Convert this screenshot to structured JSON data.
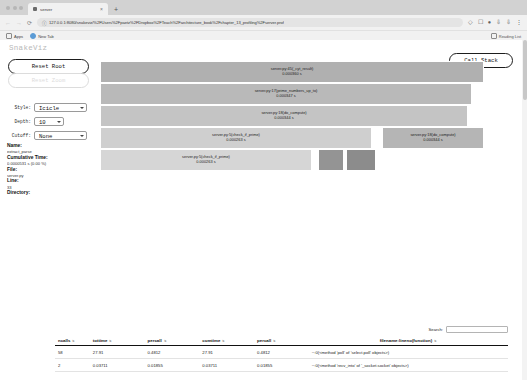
{
  "browser": {
    "tab": {
      "title": "server",
      "close_label": "×"
    },
    "new_tab_label": "+",
    "window_menu_caret": "⌄",
    "nav": {
      "back": "←",
      "forward": "→",
      "reload": "⟳"
    },
    "omnibox": {
      "lock_icon": "ⓘ",
      "url": "127.0.0.1:8080/snakeviz/%2FUsers%2Fpaetz%2FDropbox%2FTeach%2Farchitecture_book%2Fchapter_13_profiling%2Fserver.prof"
    },
    "toolbar_icons": [
      "share-icon",
      "extensions-icon",
      "profile-icon",
      "download-icon",
      "install-icon",
      "menu-icon"
    ],
    "bookmarks": [
      {
        "label": "Apps",
        "icon": "apps-icon"
      },
      {
        "label": "New Tab",
        "icon": "newtab-icon"
      }
    ],
    "reading_list": "Reading List"
  },
  "app": {
    "title": "SnakeViz",
    "reset_root_label": "Reset Root",
    "reset_zoom_label": "Reset Zoom",
    "call_stack_label": "Call Stack"
  },
  "controls": [
    {
      "name": "style",
      "label": "Style:",
      "value": "Icicle",
      "options": [
        "Icicle",
        "Sunburst"
      ]
    },
    {
      "name": "depth",
      "label": "Depth:",
      "value": "10",
      "options": [
        "5",
        "10",
        "15",
        "20"
      ]
    },
    {
      "name": "cutoff",
      "label": "Cutoff:",
      "value": "None",
      "options": [
        "None",
        "0.001",
        "0.01",
        "0.1"
      ]
    }
  ],
  "info": {
    "name_key": "Name:",
    "name_value": "extract_parse",
    "cumtime_key": "Cumulative Time:",
    "cumtime_value": "0.0000531 s (0.00 %)",
    "file_key": "File:",
    "file_value": "server.py",
    "line_key": "Line:",
    "line_value": "33",
    "directory_key": "Directory:",
    "directory_value": ""
  },
  "chart_data": {
    "type": "icicle",
    "units": "s",
    "frames": [
      {
        "label": "server.py:45(_cyt_result)",
        "time": "0.000360 s",
        "depth": 0,
        "x_pct": 0.0,
        "w_pct": 96.0,
        "color": "#b0b0b0"
      },
      {
        "label": "server.py:17(prime_numbers_up_to)",
        "time": "0.000347 s",
        "depth": 1,
        "x_pct": 0.0,
        "w_pct": 93.0,
        "color": "#b9b9b9"
      },
      {
        "label": "server.py:18(do_compute)",
        "time": "0.000344 s",
        "depth": 2,
        "x_pct": 0.0,
        "w_pct": 92.0,
        "color": "#c4c4c4"
      },
      {
        "label": "server.py:5(check_if_prime)",
        "time": "0.000263 s",
        "depth": 3,
        "x_pct": 0.0,
        "w_pct": 68.0,
        "color": "#cfcfcf"
      },
      {
        "label": "server.py:18(do_compute)",
        "time": "0.000344 s",
        "depth": 3,
        "x_pct": 70.5,
        "w_pct": 25.5,
        "color": "#b5b5b5"
      },
      {
        "label": "server.py:5(check_if_prime)",
        "time": "0.000263 s",
        "depth": 4,
        "x_pct": 0.0,
        "w_pct": 53.0,
        "color": "#d6d6d6"
      },
      {
        "label": "",
        "time": "",
        "depth": 4,
        "x_pct": 54.5,
        "w_pct": 6.5,
        "color": "#949494"
      },
      {
        "label": "",
        "time": "",
        "depth": 4,
        "x_pct": 61.5,
        "w_pct": 7.5,
        "color": "#8c8c8c"
      }
    ]
  },
  "table": {
    "search_label": "Search:",
    "search_value": "",
    "search_placeholder": "",
    "columns": [
      {
        "key": "ncalls",
        "label": "ncalls"
      },
      {
        "key": "tottime",
        "label": "tottime"
      },
      {
        "key": "percall1",
        "label": "percall"
      },
      {
        "key": "cumtime",
        "label": "cumtime"
      },
      {
        "key": "percall2",
        "label": "percall"
      },
      {
        "key": "filename",
        "label": "filename:lineno(function)"
      }
    ],
    "rows": [
      {
        "ncalls": "58",
        "tottime": "27.91",
        "percall1": "0.4812",
        "cumtime": "27.91",
        "percall2": "0.4812",
        "filename": "~:0(<method 'poll' of 'select.poll' objects>)"
      },
      {
        "ncalls": "2",
        "tottime": "0.03711",
        "percall1": "0.01855",
        "cumtime": "0.03711",
        "percall2": "0.01855",
        "filename": "~:0(<method 'recv_into' of '_socket.socket' objects>)"
      }
    ]
  }
}
